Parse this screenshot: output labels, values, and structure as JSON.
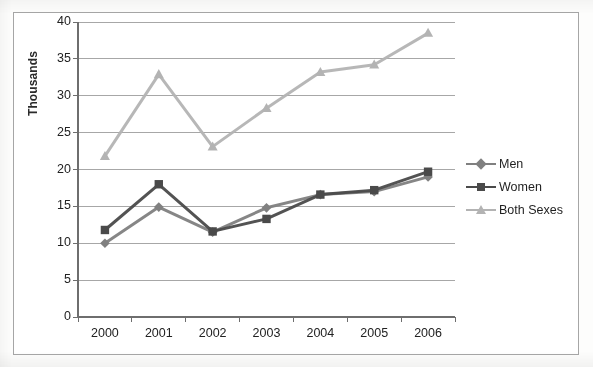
{
  "chart_data": {
    "type": "line",
    "title": "",
    "xlabel": "",
    "ylabel": "Thousands",
    "categories": [
      "2000",
      "2001",
      "2002",
      "2003",
      "2004",
      "2005",
      "2006"
    ],
    "ylim": [
      0,
      40
    ],
    "ytick_step": 5,
    "yticks": [
      "0",
      "5",
      "10",
      "15",
      "20",
      "25",
      "30",
      "35",
      "40"
    ],
    "grid": "horizontal",
    "legend_position": "right",
    "series": [
      {
        "name": "Men",
        "color": "#808080",
        "marker": "diamond",
        "values": [
          10.0,
          14.9,
          11.5,
          14.8,
          16.6,
          17.0,
          19.0
        ]
      },
      {
        "name": "Women",
        "color": "#4a4a4a",
        "marker": "square",
        "values": [
          11.8,
          18.0,
          11.6,
          13.3,
          16.6,
          17.2,
          19.7
        ]
      },
      {
        "name": "Both Sexes",
        "color": "#b3b3b3",
        "marker": "triangle",
        "values": [
          21.8,
          32.9,
          23.1,
          28.3,
          33.2,
          34.2,
          38.5
        ]
      }
    ]
  },
  "axis": {
    "y_title": "Thousands"
  },
  "legend": {
    "entries": [
      {
        "label": "Men"
      },
      {
        "label": "Women"
      },
      {
        "label": "Both Sexes"
      }
    ]
  },
  "colors": {
    "men": "#808080",
    "women": "#4a4a4a",
    "both_sexes": "#b3b3b3",
    "grid": "#8c8c8c",
    "axis": "#6e6e6e",
    "frame": "#a6a6a6",
    "text": "#222222"
  }
}
